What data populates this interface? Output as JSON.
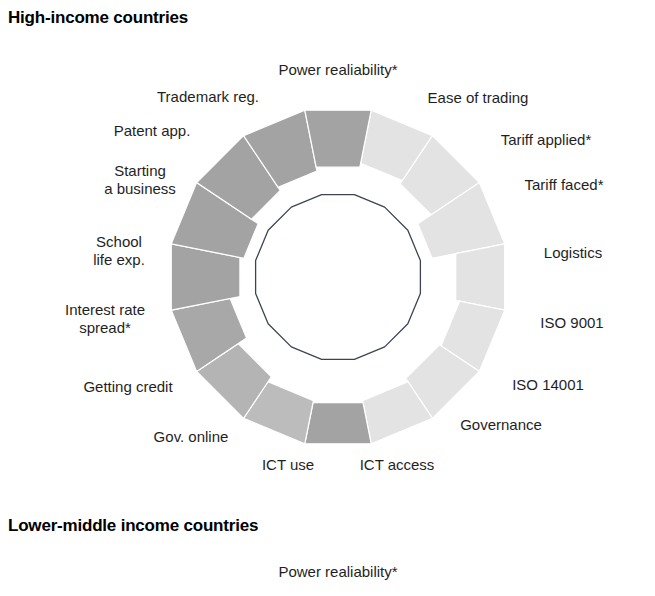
{
  "figure": {
    "background": "#ffffff",
    "panels": [
      {
        "key": "high_income",
        "title": "High-income countries"
      },
      {
        "key": "lower_middle_income",
        "title": "Lower-middle income countries"
      }
    ]
  },
  "palette": {
    "dark_gray": "#a3a3a3",
    "mid_gray": "#c0c0c0",
    "light_gray": "#e3e3e3",
    "reference_line": "#3d4450",
    "label_text": "#1f1f1f",
    "title_text": "#000000",
    "separator": "#ffffff"
  },
  "chart_data": {
    "type": "pie",
    "subtype": "polar-area-donut",
    "title": "High-income countries",
    "note": "Sixteen-sector polar-area (rose) chart. Each sector spans 22.5 degrees. Inner thin polygon marks the common reference baseline; each sector is drawn as a band from its own inner radius out to the shared outer radius, so the band thickness encodes the value.",
    "legend": null,
    "grid": false,
    "sector_count": 16,
    "sector_span_degrees": 22.5,
    "start_angle_degrees": -101.25,
    "geometry": {
      "center_x": 338,
      "center_y": 277,
      "outer_radius": 170,
      "reference_radius": 84,
      "label_radius": 205
    },
    "radius_scale": [
      0,
      170
    ],
    "categories": [
      "Power realiability*",
      "Ease of trading",
      "Tariff applied*",
      "Tariff faced*",
      "Logistics",
      "ISO 9001",
      "ISO 14001",
      "Governance",
      "ICT access",
      "ICT use",
      "Gov. online",
      "Getting credit",
      "Interest rate\nspread*",
      "School\nlife exp.",
      "Starting\na business",
      "Patent app.",
      "Trademark reg."
    ],
    "sectors": [
      {
        "label": "Power realiability*",
        "inner_radius": 118,
        "value": 52,
        "color": "#e3e3e3"
      },
      {
        "label": "Ease of trading",
        "inner_radius": 116,
        "value": 54,
        "color": "#e3e3e3"
      },
      {
        "label": "Tariff applied*",
        "inner_radius": 112,
        "value": 58,
        "color": "#e3e3e3"
      },
      {
        "label": "Tariff faced*",
        "inner_radius": 96,
        "value": 74,
        "color": "#e3e3e3"
      },
      {
        "label": "Logistics",
        "inner_radius": 120,
        "value": 50,
        "color": "#e3e3e3"
      },
      {
        "label": "ISO 9001",
        "inner_radius": 124,
        "value": 46,
        "color": "#e3e3e3"
      },
      {
        "label": "ISO 14001",
        "inner_radius": 122,
        "value": 48,
        "color": "#e3e3e3"
      },
      {
        "label": "Governance",
        "inner_radius": 126,
        "value": 44,
        "color": "#e3e3e3"
      },
      {
        "label": "ICT access",
        "inner_radius": 128,
        "value": 42,
        "color": "#a3a3a3"
      },
      {
        "label": "ICT use",
        "inner_radius": 126,
        "value": 44,
        "color": "#bcbcbc"
      },
      {
        "label": "Gov. online",
        "inner_radius": 120,
        "value": 50,
        "color": "#b4b4b4"
      },
      {
        "label": "Getting credit",
        "inner_radius": 110,
        "value": 60,
        "color": "#a8a8a8"
      },
      {
        "label": "Interest rate\nspread*",
        "inner_radius": 100,
        "value": 70,
        "color": "#a3a3a3"
      },
      {
        "label": "School\nlife exp.",
        "inner_radius": 96,
        "value": 74,
        "color": "#a3a3a3"
      },
      {
        "label": "Starting\na business",
        "inner_radius": 104,
        "value": 66,
        "color": "#a3a3a3"
      },
      {
        "label": "Patent app.",
        "inner_radius": 108,
        "value": 62,
        "color": "#a3a3a3"
      },
      {
        "label": "Trademark reg.",
        "inner_radius": 112,
        "value": 58,
        "color": "#a3a3a3"
      }
    ],
    "reference_polygon": {
      "radius": 84,
      "stroke": "#3d4450",
      "stroke_width": 1.3,
      "fill": "none",
      "sides": 16
    }
  },
  "labels_top": [
    {
      "key": "power-realiability",
      "text": "Power realiability*",
      "x": 338,
      "y": 70,
      "align": "center"
    },
    {
      "key": "ease-of-trading",
      "text": "Ease of trading",
      "x": 478,
      "y": 98,
      "align": "center"
    },
    {
      "key": "tariff-applied",
      "text": "Tariff applied*",
      "x": 546,
      "y": 140,
      "align": "center"
    },
    {
      "key": "tariff-faced",
      "text": "Tariff faced*",
      "x": 564,
      "y": 185,
      "align": "center"
    },
    {
      "key": "logistics",
      "text": "Logistics",
      "x": 573,
      "y": 253,
      "align": "center"
    },
    {
      "key": "iso-9001",
      "text": "ISO 9001",
      "x": 572,
      "y": 323,
      "align": "center"
    },
    {
      "key": "iso-14001",
      "text": "ISO 14001",
      "x": 548,
      "y": 385,
      "align": "center"
    },
    {
      "key": "governance",
      "text": "Governance",
      "x": 501,
      "y": 425,
      "align": "center"
    },
    {
      "key": "ict-access",
      "text": "ICT access",
      "x": 397,
      "y": 465,
      "align": "center"
    },
    {
      "key": "ict-use",
      "text": "ICT use",
      "x": 288,
      "y": 465,
      "align": "center"
    },
    {
      "key": "gov-online",
      "text": "Gov. online",
      "x": 191,
      "y": 437,
      "align": "center"
    },
    {
      "key": "getting-credit",
      "text": "Getting credit",
      "x": 128,
      "y": 387,
      "align": "center"
    },
    {
      "key": "interest-rate-spread",
      "text": "Interest rate\nspread*",
      "x": 105,
      "y": 319,
      "align": "center"
    },
    {
      "key": "school-life-exp",
      "text": "School\nlife exp.",
      "x": 119,
      "y": 251,
      "align": "center"
    },
    {
      "key": "starting-a-business",
      "text": "Starting\na business",
      "x": 140,
      "y": 180,
      "align": "center"
    },
    {
      "key": "patent-app",
      "text": "Patent app.",
      "x": 152,
      "y": 131,
      "align": "center"
    },
    {
      "key": "trademark-reg",
      "text": "Trademark reg.",
      "x": 208,
      "y": 97,
      "align": "center"
    }
  ],
  "labels_bottom": [
    {
      "key": "power-realiability-2",
      "text": "Power realiability*",
      "x": 338,
      "y": 72,
      "align": "center"
    }
  ]
}
